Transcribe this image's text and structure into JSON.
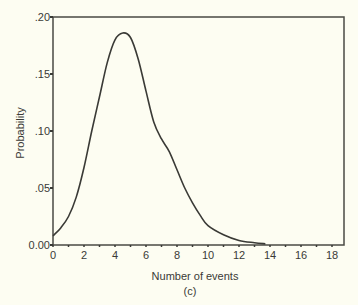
{
  "chart_data": {
    "type": "line",
    "title": "",
    "subtitle": "(c)",
    "xlabel": "Number of events",
    "ylabel": "Probability",
    "xlim": [
      0,
      18.8
    ],
    "ylim": [
      0,
      0.2
    ],
    "grid": false,
    "legend": null,
    "x_ticks": [
      0,
      2,
      4,
      6,
      8,
      10,
      12,
      14,
      16,
      18
    ],
    "x_tick_labels": [
      "0",
      "2",
      "4",
      "6",
      "8",
      "10",
      "12",
      "14",
      "16",
      "18"
    ],
    "y_ticks": [
      0,
      0.05,
      0.1,
      0.15,
      0.2
    ],
    "y_tick_labels": [
      "0.00",
      ".05",
      ".10",
      ".15",
      ".20"
    ],
    "series": [
      {
        "name": "Probability",
        "x": [
          0,
          0.5,
          1,
          1.5,
          2,
          2.5,
          3,
          3.5,
          4,
          4.5,
          5,
          5.5,
          6,
          6.5,
          7,
          7.5,
          8,
          8.5,
          9,
          9.5,
          10,
          11,
          12,
          13,
          13.7
        ],
        "values": [
          0.008,
          0.015,
          0.025,
          0.042,
          0.068,
          0.1,
          0.13,
          0.16,
          0.18,
          0.186,
          0.182,
          0.163,
          0.135,
          0.108,
          0.093,
          0.082,
          0.066,
          0.05,
          0.037,
          0.026,
          0.017,
          0.009,
          0.004,
          0.002,
          0.001
        ]
      }
    ]
  }
}
